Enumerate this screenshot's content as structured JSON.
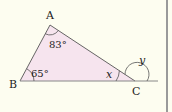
{
  "figure": {
    "vertices": {
      "A": "A",
      "B": "B",
      "C": "C"
    },
    "angles": {
      "A": "83°",
      "B": "65°",
      "C_interior": "x",
      "C_exterior": "y"
    },
    "colors": {
      "background": "#fdfdf0",
      "triangle_fill": "#f6e4ee",
      "line": "#555555",
      "border": "#9a9a9a"
    }
  }
}
